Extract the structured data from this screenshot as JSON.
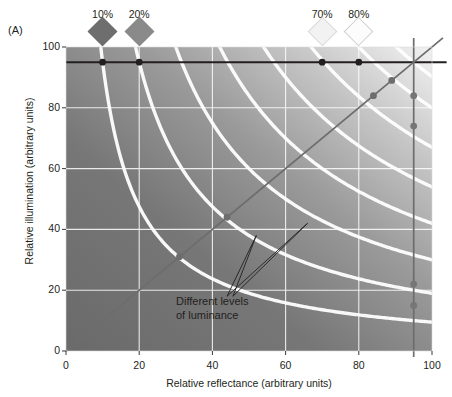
{
  "panel": {
    "label": "(A)"
  },
  "axes": {
    "x": {
      "title": "Relative reflectance (arbitrary units)",
      "ticks": [
        0,
        20,
        40,
        60,
        80,
        100
      ],
      "min": 0,
      "max": 100
    },
    "y": {
      "title": "Relative illumination (arbitrary units)",
      "ticks": [
        0,
        20,
        40,
        60,
        80,
        100
      ],
      "min": 0,
      "max": 100
    }
  },
  "diamonds": [
    {
      "label": "10%",
      "x": 10,
      "fill": "#6e6e6e",
      "stroke": "#6e6e6e"
    },
    {
      "label": "20%",
      "x": 20,
      "fill": "#8a8a8a",
      "stroke": "#8a8a8a"
    },
    {
      "label": "70%",
      "x": 70,
      "fill": "#f2f2f2",
      "stroke": "#d8d8d8"
    },
    {
      "label": "80%",
      "x": 80,
      "fill": "#fcfcfc",
      "stroke": "#cfcfcf"
    }
  ],
  "annotation": {
    "line1": "Different levels",
    "line2": "of luminance",
    "tip": {
      "x": 44,
      "y": 18
    },
    "targets": [
      {
        "x": 52,
        "y": 38
      },
      {
        "x": 66,
        "y": 42
      }
    ]
  },
  "colors": {
    "plot_dark": "#6f6f6f",
    "plot_light": "#ececec",
    "gridline": "#ffffff",
    "isoluminance_curve": "#ffffff",
    "black_line": "#231f20",
    "gray_line": "#6d6d6d",
    "black_dot": "#231f20",
    "gray_dot": "#767676",
    "text": "#231f20"
  },
  "chart_data": {
    "type": "line",
    "title": "",
    "xlabel": "Relative reflectance (arbitrary units)",
    "ylabel": "Relative illumination (arbitrary units)",
    "xlim": [
      0,
      100
    ],
    "ylim": [
      0,
      100
    ],
    "xticks": [
      0,
      20,
      40,
      60,
      80,
      100
    ],
    "yticks": [
      0,
      20,
      40,
      60,
      80,
      100
    ],
    "grid": true,
    "legend": "none",
    "series": [
      {
        "name": "constant illumination",
        "type": "line",
        "color": "#231f20",
        "x": [
          0,
          100
        ],
        "y": [
          95,
          95
        ],
        "points": [
          {
            "x": 10,
            "y": 95
          },
          {
            "x": 20,
            "y": 95
          },
          {
            "x": 70,
            "y": 95
          },
          {
            "x": 80,
            "y": 95
          }
        ],
        "point_color": "#231f20"
      },
      {
        "name": "constant reflectance",
        "type": "line",
        "color": "#6d6d6d",
        "x": [
          95,
          95
        ],
        "y": [
          0,
          100
        ],
        "points": [
          {
            "x": 95,
            "y": 84
          },
          {
            "x": 95,
            "y": 74
          },
          {
            "x": 95,
            "y": 22
          },
          {
            "x": 95,
            "y": 15
          }
        ],
        "point_color": "#767676"
      },
      {
        "name": "identity line",
        "type": "line",
        "color": "#6d6d6d",
        "x": [
          0,
          100
        ],
        "y": [
          0,
          100
        ],
        "points": [
          {
            "x": 31,
            "y": 31
          },
          {
            "x": 44,
            "y": 44
          },
          {
            "x": 84,
            "y": 84
          },
          {
            "x": 89,
            "y": 89
          }
        ],
        "point_color": "#6d6d6d"
      }
    ],
    "isoluminance_curves": {
      "description": "Hyperbolae where reflectance x illumination = constant luminance",
      "constants": [
        950,
        1900,
        3000,
        4200,
        5400,
        6700,
        8000,
        9025
      ]
    },
    "background": {
      "description": "Luminance gradient, dark at low reflectance/illumination, light at high",
      "from": "#6f6f6f",
      "to": "#ececec"
    },
    "annotations": [
      {
        "text": "Different levels of luminance",
        "x": 44,
        "y": 18
      }
    ]
  }
}
